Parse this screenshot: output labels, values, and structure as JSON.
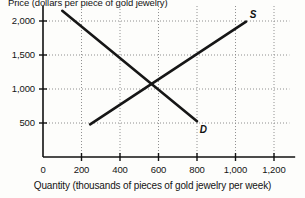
{
  "chart_data": {
    "type": "line",
    "title": "Price (dollars per piece of gold jewelry)",
    "ylabel": "Price (dollars per piece of gold jewelry)",
    "xlabel": "Quantity (thousands of pieces of gold jewelry per week)",
    "grid": true,
    "legend": "inline-curve-labels",
    "xlim": [
      0,
      1280
    ],
    "ylim": [
      0,
      2200
    ],
    "xticks": [
      0,
      200,
      400,
      600,
      800,
      1000,
      1200
    ],
    "xtick_labels": [
      "0",
      "200",
      "400",
      "600",
      "800",
      "1,000",
      "1,200"
    ],
    "yticks": [
      500,
      1000,
      1500,
      2000
    ],
    "ytick_labels": [
      "500",
      "1,000",
      "1,500",
      "2,000"
    ],
    "series": [
      {
        "name": "D",
        "label": "D",
        "description": "Demand curve, downward sloping",
        "points": [
          [
            100,
            2150
          ],
          [
            800,
            525
          ]
        ]
      },
      {
        "name": "S",
        "label": "S",
        "description": "Supply curve, upward sloping",
        "points": [
          [
            245,
            480
          ],
          [
            1055,
            1990
          ]
        ]
      }
    ],
    "equilibrium": {
      "quantity": 600,
      "price": 1000
    },
    "annotations": [
      {
        "text": "D",
        "x": 830,
        "y": 380
      },
      {
        "text": "S",
        "x": 1090,
        "y": 2080
      }
    ]
  },
  "style": {
    "axis_color": "#111111",
    "grid_color": "#8e8e8e",
    "curve_color": "#161616",
    "background": "#fdfdfb"
  }
}
